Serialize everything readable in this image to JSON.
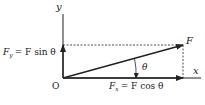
{
  "diagram": {
    "axes": {
      "x_label": "x",
      "y_label": "y",
      "origin_label": "O"
    },
    "force": {
      "label": "F",
      "angle_label": "θ"
    },
    "components": {
      "fx": {
        "symbol": "F",
        "subscript": "x",
        "equation": "= F cos θ"
      },
      "fy": {
        "symbol": "F",
        "subscript": "y",
        "equation": "= F sin θ"
      }
    },
    "colors": {
      "line": "#222222",
      "background": "#ffffff"
    }
  }
}
